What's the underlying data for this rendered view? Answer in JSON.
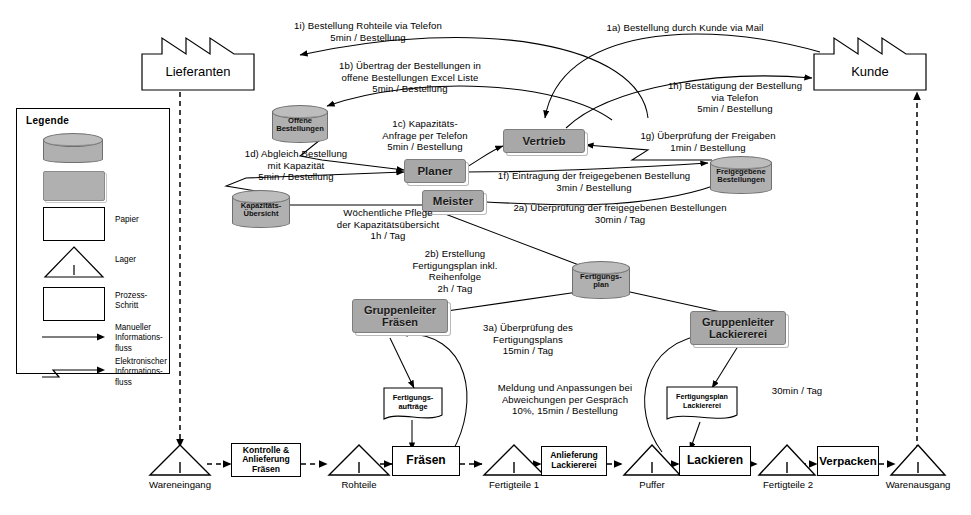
{
  "diagram": {
    "colors": {
      "role_fill": "#a8a8a8",
      "cylinder_fill": "#b0b0b0",
      "line": "#000000",
      "paper_fill": "#ffffff"
    }
  },
  "legend": {
    "title": "Legende",
    "items": [
      {
        "symbol": "database-cylinder",
        "label": ""
      },
      {
        "symbol": "grey-role-box",
        "label": ""
      },
      {
        "symbol": "paper",
        "label": "Papier"
      },
      {
        "symbol": "triangle-inventory",
        "label": "Lager"
      },
      {
        "symbol": "process-rectangle",
        "label": "Prozess-\nSchritt"
      },
      {
        "symbol": "straight-arrow",
        "label": "Manueller\nInformations-\nfluss"
      },
      {
        "symbol": "zigzag-arrow",
        "label": "Elektronischer\nInformations-\nfluss"
      }
    ]
  },
  "external": {
    "supplier": "Lieferanten",
    "customer": "Kunde"
  },
  "roles": [
    {
      "id": "vertrieb",
      "label": "Vertrieb"
    },
    {
      "id": "planer",
      "label": "Planer"
    },
    {
      "id": "meister",
      "label": "Meister"
    },
    {
      "id": "gl-fraesen",
      "label": "Gruppenleiter\nFräsen"
    },
    {
      "id": "gl-lackiererei",
      "label": "Gruppenleiter\nLackiererei"
    }
  ],
  "databases": [
    {
      "id": "offene-bestellungen",
      "label": "Offene\nBestellungen"
    },
    {
      "id": "kapazitaets-uebersicht",
      "label": "Kapazitäts-\nÜbersicht"
    },
    {
      "id": "freigegebene-bestellungen",
      "label": "Freigegebene\nBestellungen"
    },
    {
      "id": "fertigungsplan",
      "label": "Fertigungs-\nplan"
    }
  ],
  "papers": [
    {
      "id": "fertigungsauftraege",
      "label": "Fertigungs-\naufträge"
    },
    {
      "id": "fertigungsplan-lackiererei",
      "label": "Fertigungsplan\nLackiererei"
    }
  ],
  "annotations": [
    {
      "id": "a1i",
      "text": "1i) Bestellung Rohteile via Telefon\n5min / Bestellung"
    },
    {
      "id": "a1a",
      "text": "1a) Bestellung durch Kunde via Mail"
    },
    {
      "id": "a1b",
      "text": "1b) Übertrag der Bestellungen in\noffene Bestellungen Excel Liste\n5min / Bestellung"
    },
    {
      "id": "a1h",
      "text": "1h) Bestätigung der Bestellung\nvia Telefon\n5min / Bestellung"
    },
    {
      "id": "a1c",
      "text": "1c) Kapazitäts-\nAnfrage per Telefon\n5min / Bestellung"
    },
    {
      "id": "a1g",
      "text": "1g) Überprüfung der Freigaben\n1min / Bestellung"
    },
    {
      "id": "a1d",
      "text": "1d) Abgleich Bestellung\nmit Kapazität\n5min / Bestellung"
    },
    {
      "id": "a1f",
      "text": "1f) Eintragung der freigegebenen Bestellung\n3min / Bestellung"
    },
    {
      "id": "a2a",
      "text": "2a) Überprüfung der freigegebenen Bestellungen\n30min / Tag"
    },
    {
      "id": "awoch",
      "text": "Wöchentliche Pflege\nder Kapazitätsübersicht\n1h / Tag"
    },
    {
      "id": "a2b",
      "text": "2b) Erstellung\nFertigungsplan inkl.\nReihenfolge\n2h / Tag"
    },
    {
      "id": "a3a",
      "text": "3a) Überprüfung des\nFertigungsplans\n15min / Tag"
    },
    {
      "id": "ameld",
      "text": "Meldung und Anpassungen bei\nAbweichungen per Gespräch\n10%, 15min / Bestellung"
    },
    {
      "id": "a30min",
      "text": "30min / Tag"
    }
  ],
  "value_stream": [
    {
      "id": "wareneingang",
      "type": "triangle",
      "label": "Wareneingang",
      "marker": "I"
    },
    {
      "id": "kontrolle-anlieferung-fraesen",
      "type": "process",
      "label": "Kontrolle &\nAnlieferung\nFräsen"
    },
    {
      "id": "rohteile",
      "type": "triangle",
      "label": "Rohteile",
      "marker": "I"
    },
    {
      "id": "fraesen",
      "type": "process",
      "label": "Fräsen"
    },
    {
      "id": "fertigteile-1",
      "type": "triangle",
      "label": "Fertigteile 1",
      "marker": "I"
    },
    {
      "id": "anlieferung-lackiererei",
      "type": "process",
      "label": "Anlieferung\nLackiererei"
    },
    {
      "id": "puffer",
      "type": "triangle",
      "label": "Puffer",
      "marker": "I"
    },
    {
      "id": "lackieren",
      "type": "process",
      "label": "Lackieren"
    },
    {
      "id": "fertigteile-2",
      "type": "triangle",
      "label": "Fertigteile 2",
      "marker": "I"
    },
    {
      "id": "verpacken",
      "type": "process",
      "label": "Verpacken"
    },
    {
      "id": "warenausgang",
      "type": "triangle",
      "label": "Warenausgang",
      "marker": "I"
    }
  ]
}
